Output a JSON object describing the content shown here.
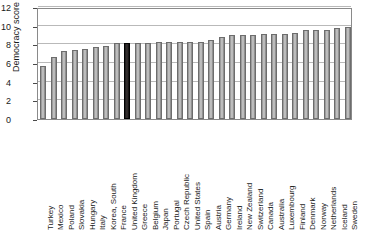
{
  "chart_data": {
    "type": "bar",
    "title": "",
    "subtitle": "",
    "xlabel": "",
    "ylabel": "Democracy score",
    "ylim": [
      0,
      12
    ],
    "yticks": [
      0,
      2,
      4,
      6,
      8,
      10,
      12
    ],
    "grid": true,
    "legend": null,
    "highlight_category": "United Kingdom",
    "highlight_color": "#1a1a1a",
    "bar_color": "#a9a9a9",
    "categories": [
      "Turkey",
      "Mexico",
      "Poland",
      "Slovakia",
      "Hungary",
      "Italy",
      "Korea, South",
      "France",
      "United Kingdom",
      "Greece",
      "Belgium",
      "Japan",
      "Portugal",
      "Czech Republic",
      "United States",
      "Spain",
      "Austria",
      "Germany",
      "Ireland",
      "New Zealand",
      "Switzerland",
      "Canada",
      "Australia",
      "Luxembourg",
      "Finland",
      "Denmark",
      "Norway",
      "Netherlands",
      "Iceland",
      "Sweden"
    ],
    "values": [
      5.7,
      6.6,
      7.3,
      7.4,
      7.5,
      7.7,
      7.8,
      8.1,
      8.1,
      8.1,
      8.1,
      8.2,
      8.2,
      8.2,
      8.2,
      8.3,
      8.5,
      8.8,
      9.0,
      9.0,
      9.0,
      9.1,
      9.1,
      9.1,
      9.2,
      9.5,
      9.5,
      9.5,
      9.7,
      9.9
    ]
  }
}
